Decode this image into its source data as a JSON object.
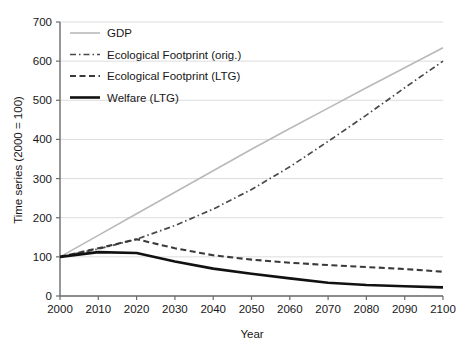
{
  "chart_data": {
    "type": "line",
    "title": "",
    "xlabel": "Year",
    "ylabel": "Time series (2000 = 100)",
    "xlim": [
      2000,
      2100
    ],
    "ylim": [
      0,
      700
    ],
    "grid": "horizontal",
    "legend_position": "top-left",
    "x": [
      2000,
      2010,
      2020,
      2030,
      2040,
      2050,
      2060,
      2070,
      2080,
      2090,
      2100
    ],
    "xticklabels": [
      "2000",
      "2010",
      "2020",
      "2030",
      "2040",
      "2050",
      "2060",
      "2070",
      "2080",
      "2090",
      "2100"
    ],
    "yticks": [
      0,
      100,
      200,
      300,
      400,
      500,
      600,
      700
    ],
    "yticklabels": [
      "0",
      "100",
      "200",
      "300",
      "400",
      "500",
      "600",
      "700"
    ],
    "series": [
      {
        "name": "GDP",
        "style": "solid",
        "color": "#b9b9b9",
        "width": 1.6,
        "values": [
          100,
          155,
          210,
          265,
          320,
          375,
          428,
          480,
          532,
          583,
          634
        ]
      },
      {
        "name": "Ecological Footprint (orig.)",
        "style": "dashdot",
        "color": "#4a4a4a",
        "width": 1.7,
        "values": [
          100,
          120,
          145,
          180,
          222,
          272,
          330,
          395,
          462,
          532,
          600
        ]
      },
      {
        "name": "Ecological Footprint (LTG)",
        "style": "dashed",
        "color": "#3a3a3a",
        "width": 2.1,
        "values": [
          100,
          122,
          145,
          122,
          104,
          93,
          85,
          79,
          74,
          69,
          62
        ]
      },
      {
        "name": "Welfare (LTG)",
        "style": "solid",
        "color": "#111111",
        "width": 2.6,
        "values": [
          100,
          112,
          110,
          88,
          70,
          57,
          45,
          34,
          28,
          25,
          22
        ]
      }
    ]
  },
  "legend": {
    "items": [
      {
        "label": "GDP",
        "swatch": "gdp-line-swatch"
      },
      {
        "label": "Ecological Footprint (orig.)",
        "swatch": "ef-orig-line-swatch"
      },
      {
        "label": "Ecological Footprint (LTG)",
        "swatch": "ef-ltg-line-swatch"
      },
      {
        "label": "Welfare (LTG)",
        "swatch": "welfare-ltg-line-swatch"
      }
    ]
  },
  "colors": {
    "gdp": "#b9b9b9",
    "ef_orig": "#4a4a4a",
    "ef_ltg": "#3a3a3a",
    "welfare": "#111111",
    "axis": "#6b6b6b",
    "grid": "#d8d8d8",
    "background": "#ffffff"
  }
}
